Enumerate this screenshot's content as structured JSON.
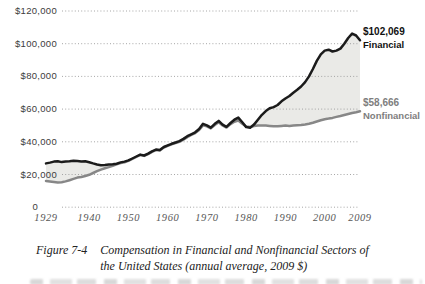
{
  "chart_data": {
    "type": "line",
    "title": "",
    "xlabel": "",
    "ylabel": "",
    "xlim": [
      1929,
      2009
    ],
    "ylim": [
      0,
      120000
    ],
    "grid": "dotted horizontal gridlines",
    "legend_position": "end-of-line labels (right side)",
    "fill_between_color": "#eaeae7",
    "x": [
      1929,
      1930,
      1931,
      1932,
      1933,
      1934,
      1935,
      1936,
      1937,
      1938,
      1939,
      1940,
      1941,
      1942,
      1943,
      1944,
      1945,
      1946,
      1947,
      1948,
      1949,
      1950,
      1951,
      1952,
      1953,
      1954,
      1955,
      1956,
      1957,
      1958,
      1959,
      1960,
      1961,
      1962,
      1963,
      1964,
      1965,
      1966,
      1967,
      1968,
      1969,
      1970,
      1971,
      1972,
      1973,
      1974,
      1975,
      1976,
      1977,
      1978,
      1979,
      1980,
      1981,
      1982,
      1983,
      1984,
      1985,
      1986,
      1987,
      1988,
      1989,
      1990,
      1991,
      1992,
      1993,
      1994,
      1995,
      1996,
      1997,
      1998,
      1999,
      2000,
      2001,
      2002,
      2003,
      2004,
      2005,
      2006,
      2007,
      2008,
      2009
    ],
    "series": [
      {
        "name": "Financial",
        "color": "#1b1b1b",
        "end_value": 102069,
        "values": [
          26800,
          27300,
          27900,
          28100,
          27600,
          27900,
          28100,
          28400,
          28200,
          27900,
          28100,
          27500,
          26800,
          26100,
          25700,
          25900,
          26100,
          26300,
          26600,
          27400,
          27900,
          28600,
          29800,
          31000,
          32200,
          31600,
          32800,
          34200,
          35200,
          34900,
          36800,
          37800,
          38800,
          39600,
          40400,
          41800,
          43400,
          44600,
          45800,
          47800,
          51000,
          50000,
          48600,
          51000,
          52800,
          50500,
          49200,
          51500,
          53500,
          54800,
          52000,
          49000,
          48600,
          50500,
          53500,
          56500,
          58800,
          60500,
          61200,
          62500,
          64800,
          66500,
          68000,
          70000,
          71800,
          73800,
          76500,
          80000,
          84500,
          89500,
          93500,
          95800,
          96300,
          95200,
          95800,
          97000,
          100000,
          103500,
          106200,
          105000,
          102069
        ]
      },
      {
        "name": "Nonfinancial",
        "color": "#878787",
        "end_value": 58666,
        "values": [
          16000,
          15700,
          15400,
          15100,
          15200,
          15800,
          16500,
          17300,
          18100,
          18500,
          19100,
          19800,
          20900,
          22000,
          23000,
          23800,
          24500,
          25300,
          26200,
          27000,
          27500,
          28300,
          29500,
          30700,
          31900,
          31400,
          32500,
          33900,
          34900,
          34700,
          36500,
          37500,
          38500,
          39200,
          40000,
          41300,
          42800,
          44200,
          45400,
          47200,
          50000,
          49400,
          48200,
          50300,
          51900,
          50000,
          48700,
          50800,
          52300,
          53000,
          51000,
          49300,
          49000,
          49600,
          49900,
          50000,
          49900,
          49700,
          49500,
          49500,
          49700,
          49900,
          49700,
          49900,
          50100,
          50300,
          50600,
          51000,
          51600,
          52400,
          53200,
          53800,
          54200,
          54600,
          55200,
          55800,
          56400,
          57000,
          57600,
          58100,
          58666
        ]
      }
    ],
    "y_ticks": [
      {
        "value": 120000,
        "label": "$120,000"
      },
      {
        "value": 100000,
        "label": "$100,000"
      },
      {
        "value": 80000,
        "label": "$80,000"
      },
      {
        "value": 60000,
        "label": "$60,000"
      },
      {
        "value": 40000,
        "label": "$40,000"
      },
      {
        "value": 20000,
        "label": "$20,000"
      },
      {
        "value": 0,
        "label": "0"
      }
    ],
    "x_ticks": [
      {
        "value": 1929,
        "label": "1929"
      },
      {
        "value": 1940,
        "label": "1940"
      },
      {
        "value": 1950,
        "label": "1950"
      },
      {
        "value": 1960,
        "label": "1960"
      },
      {
        "value": 1970,
        "label": "1970"
      },
      {
        "value": 1980,
        "label": "1980"
      },
      {
        "value": 1990,
        "label": "1990"
      },
      {
        "value": 2000,
        "label": "2000"
      },
      {
        "value": 2009,
        "label": "2009"
      }
    ],
    "annotations": {
      "financial": {
        "value_label": "$102,069",
        "name_label": "Financial"
      },
      "nonfinancial": {
        "value_label": "$58,666",
        "name_label": "Nonfinancial"
      }
    }
  },
  "caption": {
    "figure_label": "Figure 7-4",
    "line1": "Compensation in Financial and Nonfinancial Sectors of",
    "line2": "the United States (annual average, 2009 $)"
  }
}
